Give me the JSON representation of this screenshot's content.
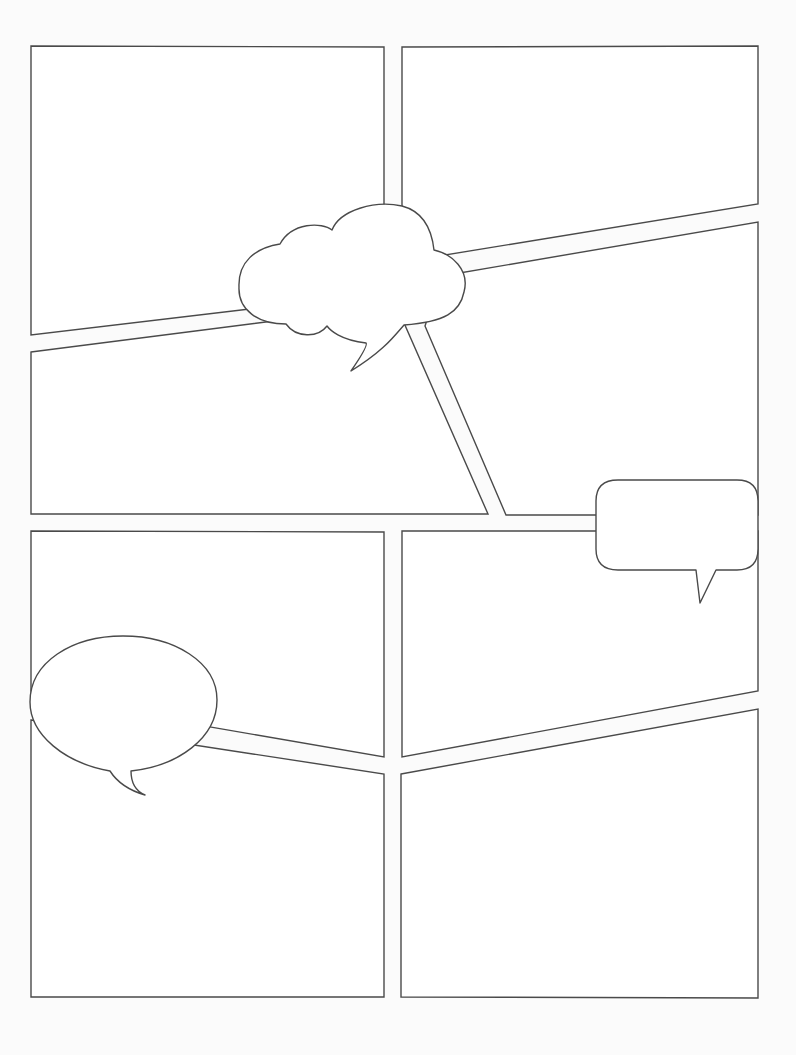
{
  "page": {
    "type": "blank-comic-storyboard-template",
    "width": 796,
    "height": 1055,
    "background": "#fbfbfb",
    "panel_fill": "#ffffff",
    "stroke_color": "#4a4a4a",
    "text": []
  },
  "panels": [
    {
      "id": "panel-1",
      "label": "",
      "points": "31,46 384,47 384,293 31,335"
    },
    {
      "id": "panel-2",
      "label": "",
      "points": "402,47 758,46 758,204 402,262"
    },
    {
      "id": "panel-3",
      "label": "",
      "points": "31,352 384,307 404,323 488,514 31,514"
    },
    {
      "id": "panel-4",
      "label": "",
      "points": "442,276 758,222 758,515 506,515 425,326"
    },
    {
      "id": "panel-5",
      "label": "",
      "points": "31,531 384,532 384,757 31,696"
    },
    {
      "id": "panel-6",
      "label": "",
      "points": "402,531 758,531 758,691 402,757"
    },
    {
      "id": "panel-7",
      "label": "",
      "points": "31,720 384,774 384,997 31,997"
    },
    {
      "id": "panel-8",
      "label": "",
      "points": "401,774 758,709 758,998 401,997"
    }
  ],
  "balloons": [
    {
      "id": "thought-cloud-balloon",
      "kind": "cloud",
      "text": "",
      "path": "M 280,244 C 292,222 322,222 332,230 C 340,210 375,200 402,206 C 425,212 432,232 434,250 C 452,254 470,270 464,292 C 460,312 445,322 404,325 C 395,335 385,350 351,371 C 360,358 368,345 366,343 C 340,340 330,330 327,326 C 318,338 296,338 286,324 C 258,324 238,310 239,287 C 238,262 255,248 280,244 Z"
    },
    {
      "id": "rounded-rect-speech-balloon",
      "kind": "speech",
      "text": "",
      "path": "M 618,480 L 737,480 Q 758,480 758,501 L 758,549 Q 758,570 737,570 L 716,570 L 700,603 L 696,570 L 618,570 Q 596,570 596,549 L 596,501 Q 596,480 618,480 Z"
    },
    {
      "id": "oval-speech-balloon",
      "kind": "speech",
      "text": "",
      "path": "M 110,771 C 65,763 30,735 30,702 C 30,662 72,636 123,636 C 174,636 217,662 217,700 C 217,738 178,766 131,771 C 131,785 138,792 145,795 C 128,790 117,782 110,771 Z"
    }
  ]
}
